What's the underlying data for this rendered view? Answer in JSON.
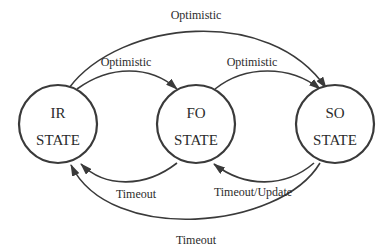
{
  "diagram": {
    "type": "state-machine",
    "colors": {
      "stroke": "#3a3a3a",
      "text": "#2b2b2b",
      "background": "#ffffff"
    },
    "states": [
      {
        "id": "ir",
        "line1": "IR",
        "line2": "STATE"
      },
      {
        "id": "fo",
        "line1": "FO",
        "line2": "STATE"
      },
      {
        "id": "so",
        "line1": "SO",
        "line2": "STATE"
      }
    ],
    "transitions": [
      {
        "from": "IR",
        "to": "FO",
        "label": "Optimistic"
      },
      {
        "from": "FO",
        "to": "SO",
        "label": "Optimistic"
      },
      {
        "from": "IR",
        "to": "SO",
        "label": "Optimistic"
      },
      {
        "from": "FO",
        "to": "IR",
        "label": "Timeout"
      },
      {
        "from": "SO",
        "to": "FO",
        "label": "Timeout/Update"
      },
      {
        "from": "SO",
        "to": "IR",
        "label": "Timeout"
      }
    ]
  }
}
